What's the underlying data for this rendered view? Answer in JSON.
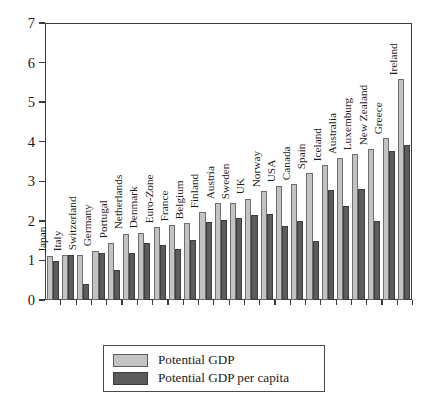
{
  "chart_data": {
    "type": "bar",
    "title": "",
    "subtitle": "",
    "xlabel": "",
    "ylabel": "",
    "ylim": [
      0,
      7
    ],
    "ytick_labels": [
      "0",
      "1",
      "2",
      "3",
      "4",
      "5",
      "6",
      "7"
    ],
    "ytick_values": [
      0,
      1,
      2,
      3,
      4,
      5,
      6,
      7
    ],
    "grid": false,
    "legend_position": "bottom-center",
    "orientation": "vertical",
    "categories": [
      "Japan",
      "Italy",
      "Switzerland",
      "Germany",
      "Portugal",
      "Netherlands",
      "Denmark",
      "Euro-Zone",
      "France",
      "Belgium",
      "Finland",
      "Austria",
      "Sweden",
      "UK",
      "Norway",
      "USA",
      "Canada",
      "Spain",
      "Iceland",
      "Australia",
      "Luxemburg",
      "New Zealand",
      "Greece",
      "Ireland"
    ],
    "series": [
      {
        "name": "Potential GDP",
        "color": "#c3c3c3",
        "values": [
          1.1,
          1.13,
          1.15,
          1.25,
          1.45,
          1.68,
          1.7,
          1.85,
          1.9,
          1.95,
          2.22,
          2.45,
          2.45,
          2.56,
          2.75,
          2.88,
          2.93,
          3.21,
          3.4,
          3.58,
          3.68,
          3.81,
          4.09,
          5.58
        ]
      },
      {
        "name": "Potential GDP per capita",
        "color": "#5c5c5c",
        "values": [
          0.98,
          1.13,
          0.4,
          1.2,
          0.77,
          1.2,
          1.45,
          1.38,
          1.3,
          1.52,
          1.98,
          2.02,
          2.08,
          2.15,
          2.17,
          1.88,
          2.0,
          1.5,
          2.78,
          2.37,
          2.81,
          2.0,
          3.76,
          3.92
        ]
      }
    ]
  },
  "legend": {
    "items": [
      {
        "label": "Potential GDP",
        "color": "#c3c3c3"
      },
      {
        "label": "Potential GDP per capita",
        "color": "#5c5c5c"
      }
    ]
  },
  "colors": {
    "potential_gdp": "#c3c3c3",
    "potential_gdp_per_capita": "#5c5c5c",
    "axis": "#3b3b3b",
    "background": "#ffffff",
    "text": "#1a1a1a"
  }
}
